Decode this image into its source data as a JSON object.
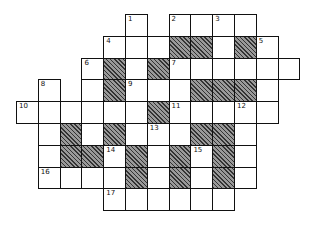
{
  "puzzle": {
    "type": "crossword",
    "origin_x": 16,
    "origin_y": 14,
    "cell_w": 21.8,
    "cell_h": 21.8,
    "rows": [
      {
        "row": 0,
        "cells": [
          5,
          7,
          8,
          9,
          10
        ],
        "blacks": []
      },
      {
        "row": 1,
        "cells": [
          4,
          5,
          6,
          7,
          8,
          9,
          10,
          11
        ],
        "blacks": [
          7,
          8,
          10
        ]
      },
      {
        "row": 2,
        "cells": [
          3,
          4,
          5,
          6,
          7,
          8,
          9,
          10,
          11,
          12
        ],
        "blacks": [
          4,
          6
        ]
      },
      {
        "row": 3,
        "cells": [
          1,
          3,
          4,
          5,
          6,
          7,
          8,
          9,
          10,
          11
        ],
        "blacks": [
          4,
          8,
          9,
          10
        ]
      },
      {
        "row": 4,
        "cells": [
          0,
          1,
          2,
          3,
          4,
          5,
          6,
          7,
          8,
          9,
          10,
          11
        ],
        "blacks": [
          6
        ]
      },
      {
        "row": 5,
        "cells": [
          1,
          2,
          3,
          4,
          5,
          6,
          7,
          8,
          9,
          10
        ],
        "blacks": [
          2,
          4,
          8,
          9
        ]
      },
      {
        "row": 6,
        "cells": [
          1,
          2,
          3,
          4,
          5,
          6,
          7,
          8,
          9,
          10
        ],
        "blacks": [
          2,
          3,
          5,
          7,
          9
        ]
      },
      {
        "row": 7,
        "cells": [
          1,
          2,
          3,
          4,
          5,
          6,
          7,
          8,
          9,
          10
        ],
        "blacks": [
          5,
          7,
          9
        ]
      },
      {
        "row": 8,
        "cells": [
          4,
          5,
          6,
          7,
          8,
          9
        ],
        "blacks": []
      }
    ],
    "numbers": [
      {
        "label": "1",
        "row": 0,
        "col": 5
      },
      {
        "label": "2",
        "row": 0,
        "col": 7
      },
      {
        "label": "3",
        "row": 0,
        "col": 9
      },
      {
        "label": "4",
        "row": 1,
        "col": 4
      },
      {
        "label": "5",
        "row": 1,
        "col": 11
      },
      {
        "label": "6",
        "row": 2,
        "col": 3
      },
      {
        "label": "7",
        "row": 2,
        "col": 7
      },
      {
        "label": "8",
        "row": 3,
        "col": 1
      },
      {
        "label": "9",
        "row": 3,
        "col": 5
      },
      {
        "label": "10",
        "row": 4,
        "col": 0
      },
      {
        "label": "11",
        "row": 4,
        "col": 7
      },
      {
        "label": "12",
        "row": 4,
        "col": 10
      },
      {
        "label": "13",
        "row": 5,
        "col": 6
      },
      {
        "label": "14",
        "row": 6,
        "col": 4
      },
      {
        "label": "15",
        "row": 6,
        "col": 8
      },
      {
        "label": "16",
        "row": 7,
        "col": 1
      },
      {
        "label": "17",
        "row": 8,
        "col": 4
      }
    ]
  }
}
